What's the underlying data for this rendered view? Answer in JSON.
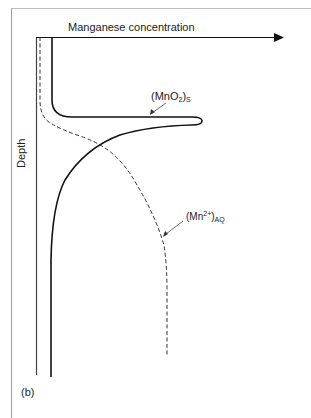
{
  "figure": {
    "panel_label": "(b)",
    "x_axis_title": "Manganese concentration",
    "y_axis_title": "Depth",
    "curves": [
      {
        "name": "MnO2 solid",
        "label_base": "(MnO",
        "label_sub1": "2",
        "label_close": ")",
        "label_sub2": "S",
        "style": "solid",
        "color": "#111111"
      },
      {
        "name": "Mn2+ aqueous",
        "label_base": "(Mn",
        "label_sup": "2+",
        "label_close": ")",
        "label_sub": "AQ",
        "style": "dashed",
        "color": "#333333"
      }
    ],
    "colors": {
      "axis": "#111111",
      "frame": "#9a9a9a",
      "background": "#ffffff"
    }
  }
}
